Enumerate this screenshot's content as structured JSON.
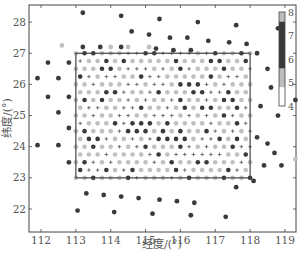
{
  "chart_data": {
    "type": "scatter",
    "title": "",
    "xlabel": "经度/(°)",
    "ylabel": "纬度/(°)",
    "xlim": [
      111.65,
      119.55
    ],
    "ylim": [
      21.55,
      28.55
    ],
    "xticks": [
      112,
      113,
      114,
      115,
      116,
      117,
      118,
      119
    ],
    "yticks": [
      22,
      23,
      24,
      25,
      26,
      27,
      28
    ],
    "grid": false,
    "colorbar": {
      "ticks": [
        4,
        5,
        6,
        7,
        8
      ],
      "range": [
        4,
        8
      ],
      "segments": [
        {
          "from": 4.0,
          "to": 4.8,
          "color": "#ffffff"
        },
        {
          "from": 4.8,
          "to": 5.6,
          "color": "#bdbdbd"
        },
        {
          "from": 5.6,
          "to": 7.6,
          "color": "#3a3a3a"
        },
        {
          "from": 7.6,
          "to": 8.0,
          "color": "#bdbdbd"
        }
      ],
      "position": "inside-top-right"
    },
    "region_box": {
      "lon": [
        113,
        118
      ],
      "lat": [
        23,
        27
      ]
    },
    "inner_grid": {
      "lon_start": 113.0,
      "lon_end": 118.0,
      "lon_step": 0.25,
      "lat_start": 23.0,
      "lat_end": 27.0,
      "lat_step": 0.25,
      "markers": "mixed: light-gray dots (value ~5), dark dots (value ~6-7), small plus signs (value ~4)"
    },
    "outer_points": [
      {
        "lon": 113.2,
        "lat": 28.3,
        "value": 7
      },
      {
        "lon": 114.3,
        "lat": 28.2,
        "value": 7
      },
      {
        "lon": 115.4,
        "lat": 28.1,
        "value": 7
      },
      {
        "lon": 116.5,
        "lat": 28.0,
        "value": 7
      },
      {
        "lon": 117.6,
        "lat": 27.9,
        "value": 7
      },
      {
        "lon": 118.8,
        "lat": 27.8,
        "value": 7
      },
      {
        "lon": 114.6,
        "lat": 27.7,
        "value": 7
      },
      {
        "lon": 115.1,
        "lat": 27.6,
        "value": 7
      },
      {
        "lon": 115.7,
        "lat": 27.5,
        "value": 7
      },
      {
        "lon": 116.2,
        "lat": 27.5,
        "value": 7
      },
      {
        "lon": 116.8,
        "lat": 27.4,
        "value": 7
      },
      {
        "lon": 117.4,
        "lat": 27.35,
        "value": 7
      },
      {
        "lon": 117.9,
        "lat": 27.3,
        "value": 7
      },
      {
        "lon": 112.6,
        "lat": 27.25,
        "value": 5
      },
      {
        "lon": 113.2,
        "lat": 27.2,
        "value": 7
      },
      {
        "lon": 113.7,
        "lat": 27.2,
        "value": 7
      },
      {
        "lon": 114.0,
        "lat": 27.2,
        "value": 5
      },
      {
        "lon": 114.3,
        "lat": 27.2,
        "value": 7
      },
      {
        "lon": 114.5,
        "lat": 27.2,
        "value": 5
      },
      {
        "lon": 115.1,
        "lat": 27.2,
        "value": 5
      },
      {
        "lon": 115.3,
        "lat": 27.15,
        "value": 7
      },
      {
        "lon": 115.8,
        "lat": 27.1,
        "value": 7
      },
      {
        "lon": 116.3,
        "lat": 27.1,
        "value": 7
      },
      {
        "lon": 118.2,
        "lat": 27.0,
        "value": 7
      },
      {
        "lon": 112.2,
        "lat": 26.7,
        "value": 7
      },
      {
        "lon": 112.8,
        "lat": 26.7,
        "value": 7
      },
      {
        "lon": 111.9,
        "lat": 26.2,
        "value": 7
      },
      {
        "lon": 112.5,
        "lat": 26.2,
        "value": 7
      },
      {
        "lon": 112.2,
        "lat": 25.6,
        "value": 7
      },
      {
        "lon": 112.8,
        "lat": 25.6,
        "value": 7
      },
      {
        "lon": 112.5,
        "lat": 25.1,
        "value": 7
      },
      {
        "lon": 112.8,
        "lat": 24.6,
        "value": 7
      },
      {
        "lon": 111.9,
        "lat": 24.05,
        "value": 7
      },
      {
        "lon": 112.5,
        "lat": 24.05,
        "value": 7
      },
      {
        "lon": 112.8,
        "lat": 23.5,
        "value": 7
      },
      {
        "lon": 118.5,
        "lat": 26.5,
        "value": 7
      },
      {
        "lon": 118.6,
        "lat": 25.9,
        "value": 7
      },
      {
        "lon": 119.3,
        "lat": 25.5,
        "value": 7
      },
      {
        "lon": 118.3,
        "lat": 25.3,
        "value": 7
      },
      {
        "lon": 118.8,
        "lat": 25.0,
        "value": 7
      },
      {
        "lon": 118.2,
        "lat": 24.3,
        "value": 7
      },
      {
        "lon": 118.5,
        "lat": 24.1,
        "value": 7
      },
      {
        "lon": 118.7,
        "lat": 23.8,
        "value": 7
      },
      {
        "lon": 119.3,
        "lat": 23.6,
        "value": 5
      },
      {
        "lon": 118.4,
        "lat": 23.4,
        "value": 7
      },
      {
        "lon": 118.9,
        "lat": 23.4,
        "value": 7
      },
      {
        "lon": 118.1,
        "lat": 22.9,
        "value": 7
      },
      {
        "lon": 117.6,
        "lat": 22.7,
        "value": 7
      },
      {
        "lon": 113.3,
        "lat": 22.5,
        "value": 7
      },
      {
        "lon": 113.8,
        "lat": 22.45,
        "value": 7
      },
      {
        "lon": 114.3,
        "lat": 22.4,
        "value": 7
      },
      {
        "lon": 114.8,
        "lat": 22.35,
        "value": 7
      },
      {
        "lon": 115.4,
        "lat": 22.3,
        "value": 7
      },
      {
        "lon": 115.9,
        "lat": 22.25,
        "value": 7
      },
      {
        "lon": 116.4,
        "lat": 22.2,
        "value": 7
      },
      {
        "lon": 113.05,
        "lat": 21.95,
        "value": 7
      },
      {
        "lon": 114.1,
        "lat": 21.9,
        "value": 7
      },
      {
        "lon": 115.2,
        "lat": 21.85,
        "value": 7
      },
      {
        "lon": 116.3,
        "lat": 21.8,
        "value": 7
      },
      {
        "lon": 117.3,
        "lat": 21.75,
        "value": 7
      }
    ]
  },
  "axes": {
    "xlabel": "经度/(°)",
    "ylabel": "纬度/(°)",
    "xtick_labels": [
      "112",
      "113",
      "114",
      "115",
      "116",
      "117",
      "118",
      "119"
    ],
    "ytick_labels": [
      "22",
      "23",
      "24",
      "25",
      "26",
      "27",
      "28"
    ],
    "colorbar_labels": [
      "8",
      "7",
      "6",
      "5",
      "4"
    ]
  },
  "colors": {
    "dark_point": "#3a3a3a",
    "light_point": "#c0c0c0",
    "plus": "#444444",
    "frame": "#444444",
    "text": "#555555"
  }
}
